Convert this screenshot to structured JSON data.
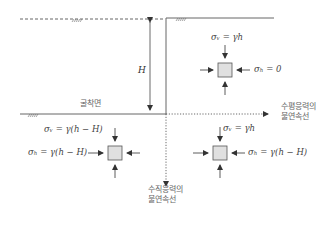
{
  "diagram": {
    "height_label": "H",
    "excavation_surface_label": "굴착면",
    "horizontal_discontinuity_label_line1": "수평응력의",
    "horizontal_discontinuity_label_line2": "불연속선",
    "vertical_discontinuity_label_line1": "수직응력의",
    "vertical_discontinuity_label_line2": "불연속선",
    "top_right_element": {
      "sigma_v": "σᵥ = γh",
      "sigma_h": "σₕ = 0"
    },
    "bottom_left_element": {
      "sigma_v": "σᵥ = γ(h − H)",
      "sigma_h": "σₕ = γ(h − H)"
    },
    "bottom_right_element": {
      "sigma_v": "σᵥ = γh",
      "sigma_h": "σₕ = γ(h − H)"
    },
    "colors": {
      "line": "#555555",
      "element_fill": "#e0e0e0",
      "element_stroke": "#555555",
      "text": "#555555"
    }
  }
}
